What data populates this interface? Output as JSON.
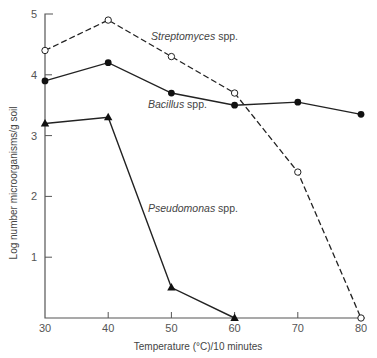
{
  "chart_data": {
    "type": "line",
    "title": "",
    "xlabel": "Temperature (°C)/10 minutes",
    "ylabel": "Log number microorganisms/g soil",
    "x": [
      30,
      40,
      50,
      60,
      70,
      80
    ],
    "xticks": [
      "30",
      "40",
      "50",
      "60",
      "70",
      "80"
    ],
    "yticks": [
      "1",
      "2",
      "3",
      "4",
      "5"
    ],
    "xlim": [
      30,
      80
    ],
    "ylim": [
      0,
      5
    ],
    "grid": false,
    "legend": "inline labels",
    "series": [
      {
        "name": "Streptomyces spp.",
        "genus": "Streptomyces",
        "suffix": "spp.",
        "marker": "open-circle",
        "linestyle": "dashed",
        "x": [
          30,
          40,
          50,
          60,
          70,
          80
        ],
        "values": [
          4.4,
          4.9,
          4.3,
          3.7,
          2.4,
          0.0
        ]
      },
      {
        "name": "Bacillus spp.",
        "genus": "Bacillus",
        "suffix": "spp.",
        "marker": "filled-circle",
        "linestyle": "solid",
        "x": [
          30,
          40,
          50,
          60,
          70,
          80
        ],
        "values": [
          3.9,
          4.2,
          3.7,
          3.5,
          3.55,
          3.35
        ]
      },
      {
        "name": "Pseudomonas spp.",
        "genus": "Pseudomonas",
        "suffix": "spp.",
        "marker": "filled-triangle",
        "linestyle": "solid",
        "x": [
          30,
          40,
          50,
          60
        ],
        "values": [
          3.2,
          3.3,
          0.5,
          0.0
        ]
      }
    ],
    "annotations": [
      {
        "text": "Streptomyces spp.",
        "x": 52,
        "y": 4.6
      },
      {
        "text": "Bacillus spp.",
        "x": 52,
        "y": 3.5
      },
      {
        "text": "Pseudomonas spp.",
        "x": 52,
        "y": 1.8
      }
    ]
  },
  "labels": {
    "x_axis": "Temperature (°C)/10 minutes",
    "y_axis": "Log number microorganisms/g soil",
    "streptomyces_genus": "Streptomyces",
    "bacillus_genus": "Bacillus",
    "pseudomonas_genus": "Pseudomonas",
    "spp": "spp."
  }
}
